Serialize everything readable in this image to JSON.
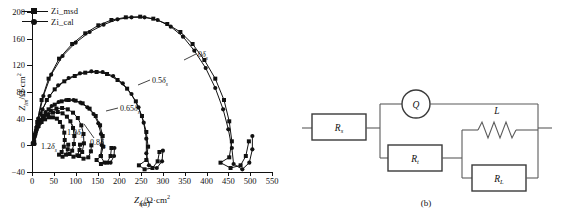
{
  "figure": {
    "panel_a_caption": "(a)",
    "panel_b_caption": "(b)"
  },
  "chart_data": {
    "type": "scatter",
    "title": "",
    "xlabel": "Zre/Ω·cm2",
    "ylabel": "Zim/Ω·cm2",
    "xlim": [
      0,
      550
    ],
    "ylim": [
      -40,
      200
    ],
    "xticks": [
      0,
      50,
      100,
      150,
      200,
      250,
      300,
      350,
      400,
      450,
      500,
      550
    ],
    "yticks": [
      -40,
      0,
      40,
      80,
      120,
      160,
      200
    ],
    "grid": false,
    "legend_position": "top-left",
    "legend": [
      {
        "name": "Zi_msd",
        "marker": "square"
      },
      {
        "name": "Zi_cal",
        "marker": "circle"
      }
    ],
    "annotations": [
      {
        "text": "0δs",
        "num": "0"
      },
      {
        "text": "0.5δs",
        "num": "0.5"
      },
      {
        "text": "0.65δs",
        "num": "0.65"
      },
      {
        "text": "0.8δs",
        "num": "0.8"
      },
      {
        "text": "1.0δs",
        "num": "1.0"
      },
      {
        "text": "1.2δs",
        "num": "1.2"
      }
    ],
    "series": [
      {
        "name": "0δs Zi_msd",
        "marker": "square",
        "points": [
          [
            5,
            5
          ],
          [
            12,
            35
          ],
          [
            22,
            68
          ],
          [
            38,
            100
          ],
          [
            62,
            130
          ],
          [
            92,
            152
          ],
          [
            122,
            168
          ],
          [
            152,
            180
          ],
          [
            182,
            188
          ],
          [
            215,
            192
          ],
          [
            248,
            193
          ],
          [
            278,
            190
          ],
          [
            310,
            182
          ],
          [
            340,
            170
          ],
          [
            368,
            152
          ],
          [
            395,
            128
          ],
          [
            420,
            100
          ],
          [
            440,
            68
          ],
          [
            452,
            36
          ],
          [
            458,
            6
          ],
          [
            452,
            -18
          ],
          [
            432,
            -26
          ],
          [
            455,
            -34
          ],
          [
            478,
            -30
          ],
          [
            490,
            -16
          ],
          [
            497,
            6
          ]
        ]
      },
      {
        "name": "0δs Zi_cal",
        "marker": "circle",
        "points": [
          [
            6,
            2
          ],
          [
            14,
            40
          ],
          [
            26,
            74
          ],
          [
            44,
            106
          ],
          [
            70,
            134
          ],
          [
            100,
            154
          ],
          [
            132,
            170
          ],
          [
            164,
            181
          ],
          [
            196,
            189
          ],
          [
            228,
            192
          ],
          [
            258,
            192
          ],
          [
            288,
            188
          ],
          [
            318,
            178
          ],
          [
            346,
            163
          ],
          [
            372,
            142
          ],
          [
            398,
            116
          ],
          [
            420,
            86
          ],
          [
            438,
            54
          ],
          [
            450,
            24
          ],
          [
            458,
            -4
          ],
          [
            462,
            -28
          ],
          [
            482,
            -36
          ],
          [
            498,
            -26
          ],
          [
            505,
            -6
          ],
          [
            505,
            14
          ]
        ]
      },
      {
        "name": "0.5δs Zi_msd",
        "marker": "square",
        "points": [
          [
            4,
            4
          ],
          [
            10,
            26
          ],
          [
            20,
            48
          ],
          [
            34,
            68
          ],
          [
            52,
            84
          ],
          [
            74,
            96
          ],
          [
            98,
            104
          ],
          [
            122,
            109
          ],
          [
            148,
            110
          ],
          [
            172,
            107
          ],
          [
            196,
            98
          ],
          [
            218,
            85
          ],
          [
            238,
            66
          ],
          [
            252,
            44
          ],
          [
            262,
            20
          ],
          [
            266,
            -2
          ],
          [
            262,
            -22
          ],
          [
            245,
            -30
          ],
          [
            258,
            -36
          ],
          [
            276,
            -34
          ],
          [
            288,
            -24
          ],
          [
            292,
            -10
          ]
        ]
      },
      {
        "name": "0.5δs Zi_cal",
        "marker": "circle",
        "points": [
          [
            5,
            2
          ],
          [
            12,
            30
          ],
          [
            24,
            54
          ],
          [
            40,
            74
          ],
          [
            60,
            90
          ],
          [
            84,
            101
          ],
          [
            110,
            108
          ],
          [
            136,
            111
          ],
          [
            162,
            110
          ],
          [
            186,
            104
          ],
          [
            208,
            93
          ],
          [
            228,
            77
          ],
          [
            244,
            57
          ],
          [
            256,
            34
          ],
          [
            262,
            10
          ],
          [
            262,
            -12
          ],
          [
            268,
            -30
          ],
          [
            286,
            -34
          ],
          [
            298,
            -24
          ],
          [
            300,
            -8
          ]
        ]
      },
      {
        "name": "0.65δs Zi_msd",
        "marker": "square",
        "points": [
          [
            3,
            3
          ],
          [
            8,
            18
          ],
          [
            15,
            32
          ],
          [
            25,
            44
          ],
          [
            38,
            54
          ],
          [
            52,
            61
          ],
          [
            68,
            66
          ],
          [
            84,
            68
          ],
          [
            100,
            67
          ],
          [
            116,
            63
          ],
          [
            132,
            55
          ],
          [
            146,
            44
          ],
          [
            156,
            30
          ],
          [
            162,
            14
          ],
          [
            163,
            -2
          ],
          [
            158,
            -16
          ],
          [
            148,
            -22
          ],
          [
            158,
            -28
          ],
          [
            172,
            -26
          ],
          [
            180,
            -16
          ],
          [
            182,
            -4
          ]
        ]
      },
      {
        "name": "0.65δs Zi_cal",
        "marker": "circle",
        "points": [
          [
            4,
            2
          ],
          [
            10,
            22
          ],
          [
            19,
            38
          ],
          [
            31,
            50
          ],
          [
            45,
            59
          ],
          [
            61,
            65
          ],
          [
            78,
            68
          ],
          [
            95,
            68
          ],
          [
            111,
            64
          ],
          [
            127,
            57
          ],
          [
            141,
            47
          ],
          [
            152,
            33
          ],
          [
            158,
            17
          ],
          [
            160,
            0
          ],
          [
            157,
            -16
          ],
          [
            166,
            -26
          ],
          [
            180,
            -26
          ],
          [
            188,
            -16
          ],
          [
            189,
            -4
          ]
        ]
      },
      {
        "name": "0.8δs Zi_msd",
        "marker": "square",
        "points": [
          [
            3,
            3
          ],
          [
            7,
            16
          ],
          [
            13,
            28
          ],
          [
            21,
            38
          ],
          [
            31,
            46
          ],
          [
            43,
            52
          ],
          [
            56,
            55
          ],
          [
            69,
            56
          ],
          [
            82,
            54
          ],
          [
            94,
            49
          ],
          [
            105,
            41
          ],
          [
            113,
            30
          ],
          [
            118,
            17
          ],
          [
            119,
            3
          ],
          [
            115,
            -10
          ],
          [
            108,
            -16
          ],
          [
            118,
            -20
          ],
          [
            129,
            -18
          ],
          [
            135,
            -9
          ],
          [
            136,
            0
          ]
        ]
      },
      {
        "name": "1.0δs Zi_msd",
        "marker": "square",
        "points": [
          [
            2,
            2
          ],
          [
            6,
            14
          ],
          [
            11,
            25
          ],
          [
            18,
            34
          ],
          [
            27,
            41
          ],
          [
            37,
            46
          ],
          [
            48,
            49
          ],
          [
            59,
            50
          ],
          [
            70,
            48
          ],
          [
            80,
            43
          ],
          [
            88,
            36
          ],
          [
            94,
            26
          ],
          [
            97,
            14
          ],
          [
            96,
            2
          ],
          [
            92,
            -8
          ],
          [
            86,
            -13
          ],
          [
            95,
            -17
          ],
          [
            104,
            -15
          ],
          [
            109,
            -7
          ],
          [
            110,
            1
          ]
        ]
      },
      {
        "name": "1.2δs Zi_msd",
        "marker": "square",
        "points": [
          [
            2,
            2
          ],
          [
            5,
            12
          ],
          [
            9,
            21
          ],
          [
            15,
            29
          ],
          [
            22,
            35
          ],
          [
            30,
            39
          ],
          [
            39,
            42
          ],
          [
            48,
            42
          ],
          [
            57,
            40
          ],
          [
            64,
            35
          ],
          [
            70,
            28
          ],
          [
            74,
            19
          ],
          [
            75,
            8
          ],
          [
            73,
            -2
          ],
          [
            68,
            -10
          ],
          [
            62,
            -14
          ],
          [
            70,
            -17
          ],
          [
            78,
            -14
          ],
          [
            82,
            -6
          ],
          [
            83,
            1
          ]
        ]
      }
    ]
  },
  "circuit": {
    "components": [
      {
        "id": "rs",
        "label": "Rs",
        "base": "R",
        "sub": "s",
        "type": "resistor"
      },
      {
        "id": "q",
        "label": "Q",
        "base": "Q",
        "sub": "",
        "type": "cpe"
      },
      {
        "id": "rt",
        "label": "Rt",
        "base": "R",
        "sub": "t",
        "type": "resistor"
      },
      {
        "id": "l",
        "label": "L",
        "base": "L",
        "sub": "",
        "type": "inductor"
      },
      {
        "id": "rl",
        "label": "RL",
        "base": "R",
        "sub": "L",
        "type": "resistor"
      }
    ]
  }
}
